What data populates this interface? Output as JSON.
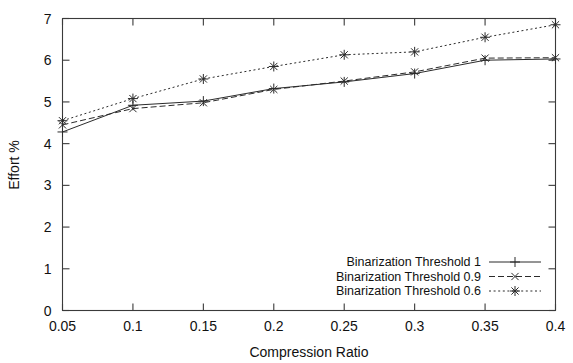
{
  "chart_data": {
    "type": "line",
    "title": "",
    "xlabel": "Compression Ratio",
    "ylabel": "Effort %",
    "x": [
      0.05,
      0.1,
      0.15,
      0.2,
      0.25,
      0.3,
      0.35,
      0.4
    ],
    "xticklabels": [
      "0.05",
      "0.1",
      "0.15",
      "0.2",
      "0.25",
      "0.3",
      "0.35",
      "0.4"
    ],
    "yticklabels": [
      "0",
      "1",
      "2",
      "3",
      "4",
      "5",
      "6",
      "7"
    ],
    "yticks": [
      0,
      1,
      2,
      3,
      4,
      5,
      6,
      7
    ],
    "xlim": [
      0.05,
      0.4
    ],
    "ylim": [
      0,
      7
    ],
    "grid": false,
    "legend_position": "bottom-right",
    "series": [
      {
        "name": "Binarization Threshold 1",
        "marker": "plus",
        "linestyle": "solid",
        "values": [
          4.28,
          4.92,
          5.02,
          5.32,
          5.48,
          5.68,
          6.0,
          6.03
        ]
      },
      {
        "name": "Binarization Threshold 0.9",
        "marker": "cross",
        "linestyle": "dashed",
        "values": [
          4.45,
          4.84,
          4.98,
          5.3,
          5.5,
          5.72,
          6.05,
          6.06
        ]
      },
      {
        "name": "Binarization Threshold 0.6",
        "marker": "star",
        "linestyle": "dotted",
        "values": [
          4.55,
          5.08,
          5.55,
          5.85,
          6.13,
          6.2,
          6.55,
          6.85
        ]
      }
    ],
    "colors": {
      "axis": "#3a3a3a",
      "line": "#2b2b2b",
      "background": "#ffffff"
    }
  },
  "axes": {
    "x_title": "Compression Ratio",
    "y_title": "Effort %"
  },
  "legend": {
    "entries": [
      {
        "label": "Binarization Threshold 1"
      },
      {
        "label": "Binarization Threshold 0.9"
      },
      {
        "label": "Binarization Threshold 0.6"
      }
    ]
  }
}
